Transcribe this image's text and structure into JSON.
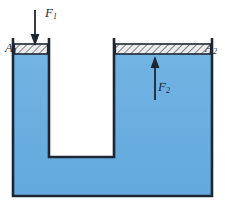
{
  "figure": {
    "name": "hydraulic-press-pascal-principle",
    "colors": {
      "fluid": "#6BAEE0",
      "fluid_shadow": "#5A9FD4",
      "outline": "#1d2633",
      "piston_fill": "#e8e8e8",
      "piston_hatch": "#2a2a2a",
      "background": "#ffffff",
      "label_text": "#1d2a3a"
    },
    "labels": {
      "area_small": "A",
      "area_small_sub": "1",
      "area_large": "A",
      "area_large_sub": "2",
      "force_small": "F",
      "force_small_sub": "1",
      "force_large": "F",
      "force_large_sub": "2"
    },
    "arrows": {
      "force_small_direction": "down",
      "force_large_direction": "up"
    },
    "icons": {
      "down_arrow": "arrow-down-icon",
      "up_arrow": "arrow-up-icon"
    }
  }
}
